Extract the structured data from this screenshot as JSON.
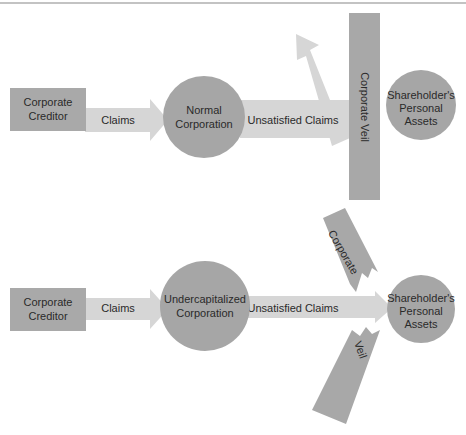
{
  "colors": {
    "box": "#a9a9a9",
    "circle": "#a6a6a6",
    "arrow": "#d6d6d6",
    "veil": "#a8a8a8",
    "text": "#2a2a2a",
    "rule": "#777777"
  },
  "top_diagram": {
    "creditor": {
      "line1": "Corporate",
      "line2": "Creditor"
    },
    "claims_arrow": "Claims",
    "corporation": {
      "line1": "Normal",
      "line2": "Corporation"
    },
    "unsatisfied_arrow": "Unsatisfied Claims",
    "veil_label": "Corporate Veil",
    "assets": {
      "line1": "Shareholder's",
      "line2": "Personal",
      "line3": "Assets"
    }
  },
  "bottom_diagram": {
    "creditor": {
      "line1": "Corporate",
      "line2": "Creditor"
    },
    "claims_arrow": "Claims",
    "corporation": {
      "line1": "Undercapitalized",
      "line2": "Corporation"
    },
    "unsatisfied_arrow": "Unsatisfied Claims",
    "veil_top_label": "Corporate",
    "veil_bottom_label": "Veil",
    "assets": {
      "line1": "Shareholder's",
      "line2": "Personal",
      "line3": "Assets"
    }
  }
}
